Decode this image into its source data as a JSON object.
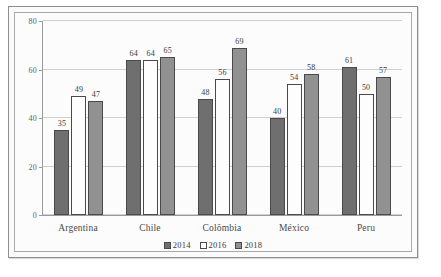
{
  "chart_data": {
    "type": "bar",
    "title": "",
    "subtitle": "",
    "xlabel": "",
    "ylabel": "",
    "categories": [
      "Argentina",
      "Chile",
      "Colômbia",
      "México",
      "Peru"
    ],
    "series": [
      {
        "name": "2014",
        "color": "#6f6f6f",
        "values": [
          35,
          64,
          48,
          40,
          61
        ]
      },
      {
        "name": "2016",
        "color": "#fdfdfd",
        "values": [
          49,
          64,
          56,
          54,
          50
        ]
      },
      {
        "name": "2018",
        "color": "#919191",
        "values": [
          47,
          65,
          69,
          58,
          57
        ]
      }
    ],
    "ylim": [
      0,
      80
    ],
    "yticks": [
      0,
      20,
      40,
      60,
      80
    ],
    "ytick_labels": [
      "0",
      "20",
      "40",
      "60",
      "80"
    ],
    "grid": true,
    "grid_axis": "y",
    "legend_position": "bottom-center",
    "data_labels": true
  },
  "legend": {
    "items": [
      {
        "label": "2014"
      },
      {
        "label": "2016"
      },
      {
        "label": "2018"
      }
    ]
  },
  "colors": {
    "series_2014": "#6f6f6f",
    "series_2016": "#fdfdfd",
    "series_2018": "#919191",
    "bar_border": "#4a4a4a",
    "gridline": "#cfcfcf",
    "axis": "#9a9a9a",
    "frame_outer": "#8e8e8e",
    "frame_inner": "#a9a9a9",
    "background": "#fbfbfb",
    "text": "#3b3b3b"
  }
}
